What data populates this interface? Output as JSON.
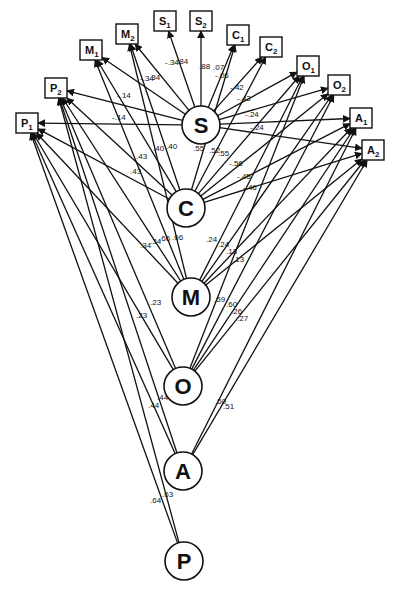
{
  "diagram": {
    "type": "path-diagram",
    "latent_nodes": [
      {
        "id": "S",
        "label": "S",
        "x": 201,
        "y": 125
      },
      {
        "id": "C",
        "label": "C",
        "x": 186,
        "y": 208
      },
      {
        "id": "M",
        "label": "M",
        "x": 191,
        "y": 297
      },
      {
        "id": "O",
        "label": "O",
        "x": 183,
        "y": 386
      },
      {
        "id": "A",
        "label": "A",
        "x": 183,
        "y": 471
      },
      {
        "id": "P",
        "label": "P",
        "x": 184,
        "y": 561
      }
    ],
    "indicator_nodes": [
      {
        "id": "P1",
        "label": "P",
        "sub": "1",
        "x": 27,
        "y": 123
      },
      {
        "id": "P2",
        "label": "P",
        "sub": "2",
        "x": 56,
        "y": 88
      },
      {
        "id": "M1",
        "label": "M",
        "sub": "1",
        "x": 91,
        "y": 50
      },
      {
        "id": "M2",
        "label": "M",
        "sub": "2",
        "x": 127,
        "y": 34
      },
      {
        "id": "S1",
        "label": "S",
        "sub": "1",
        "x": 165,
        "y": 21
      },
      {
        "id": "S2",
        "label": "S",
        "sub": "2",
        "x": 201,
        "y": 21
      },
      {
        "id": "C1",
        "label": "C",
        "sub": "1",
        "x": 238,
        "y": 35
      },
      {
        "id": "C2",
        "label": "C",
        "sub": "2",
        "x": 271,
        "y": 47
      },
      {
        "id": "O1",
        "label": "O",
        "sub": "1",
        "x": 308,
        "y": 66
      },
      {
        "id": "O2",
        "label": "O",
        "sub": "2",
        "x": 339,
        "y": 85
      },
      {
        "id": "A1",
        "label": "A",
        "sub": "1",
        "x": 361,
        "y": 118
      },
      {
        "id": "A2",
        "label": "A",
        "sub": "2",
        "x": 373,
        "y": 150
      }
    ],
    "edges": [
      {
        "from": "S",
        "to": "S1",
        "coef": "-.34"
      },
      {
        "from": "S",
        "to": "S2",
        "coef": ".84"
      },
      {
        "from": "S",
        "to": "M2",
        "coef": "-.34"
      },
      {
        "from": "S",
        "to": "M1",
        "coef": ".34"
      },
      {
        "from": "S",
        "to": "P2",
        "coef": "-.14"
      },
      {
        "from": "S",
        "to": "P1",
        "coef": "-.14"
      },
      {
        "from": "S",
        "to": "C1",
        "coef": ".88"
      },
      {
        "from": "S",
        "to": "C2",
        "coef": ".07"
      },
      {
        "from": "S",
        "to": "O1",
        "coef": "-.06"
      },
      {
        "from": "S",
        "to": "O2",
        "coef": "-.42"
      },
      {
        "from": "S",
        "to": "A1",
        "coef": "-.43"
      },
      {
        "from": "S",
        "to": "A2",
        "coef": "-.24"
      },
      {
        "from": "C",
        "to": "M2",
        "coef": ".40"
      },
      {
        "from": "C",
        "to": "M1",
        "coef": ".40"
      },
      {
        "from": "C",
        "to": "P2",
        "coef": ".43"
      },
      {
        "from": "C",
        "to": "P1",
        "coef": ".43"
      },
      {
        "from": "C",
        "to": "C1",
        "coef": ".55"
      },
      {
        "from": "C",
        "to": "C2",
        "coef": ".52"
      },
      {
        "from": "C",
        "to": "O1",
        "coef": ".55"
      },
      {
        "from": "C",
        "to": "O2",
        "coef": "-.56"
      },
      {
        "from": "C",
        "to": "A1",
        "coef": "-.45"
      },
      {
        "from": "C",
        "to": "A2",
        "coef": "-.46"
      },
      {
        "from": "M",
        "to": "P1",
        "coef": ".34"
      },
      {
        "from": "M",
        "to": "P2",
        "coef": ".34"
      },
      {
        "from": "M",
        "to": "M1",
        "coef": ".66"
      },
      {
        "from": "M",
        "to": "M2",
        "coef": ".66"
      },
      {
        "from": "M",
        "to": "O1",
        "coef": ".24"
      },
      {
        "from": "M",
        "to": "O2",
        "coef": ".24"
      },
      {
        "from": "M",
        "to": "A1",
        "coef": ".13"
      },
      {
        "from": "M",
        "to": "A2",
        "coef": ".13"
      },
      {
        "from": "O",
        "to": "P2",
        "coef": ".23"
      },
      {
        "from": "O",
        "to": "P1",
        "coef": ".23"
      },
      {
        "from": "O",
        "to": "O1",
        "coef": ".59"
      },
      {
        "from": "O",
        "to": "O2",
        "coef": ".60"
      },
      {
        "from": "O",
        "to": "A1",
        "coef": ".26"
      },
      {
        "from": "O",
        "to": "A2",
        "coef": ".27"
      },
      {
        "from": "A",
        "to": "P2",
        "coef": ".44"
      },
      {
        "from": "A",
        "to": "P1",
        "coef": ".44"
      },
      {
        "from": "A",
        "to": "A1",
        "coef": ".50"
      },
      {
        "from": "A",
        "to": "A2",
        "coef": ".51"
      },
      {
        "from": "P",
        "to": "P1",
        "coef": ".64"
      },
      {
        "from": "P",
        "to": "P2",
        "coef": ".63"
      }
    ],
    "labels": [
      {
        "text": "-.34",
        "x": 165,
        "y": 65
      },
      {
        "text": ".84",
        "x": 177,
        "y": 64
      },
      {
        "text": "-.34",
        "x": 140,
        "y": 81
      },
      {
        "text": ".34",
        "x": 149,
        "y": 80
      },
      {
        "text": "-.14",
        "x": 117,
        "y": 98
      },
      {
        "text": "-.14",
        "x": 112,
        "y": 120
      },
      {
        "text": ".88",
        "x": 199,
        "y": 69
      },
      {
        "text": ".07",
        "x": 213,
        "y": 70
      },
      {
        "text": "-.06",
        "x": 215,
        "y": 78
      },
      {
        "text": "-.42",
        "x": 230,
        "y": 90
      },
      {
        "text": "-.43",
        "x": 237,
        "y": 101
      },
      {
        "text": "-.24",
        "x": 245,
        "y": 117
      },
      {
        "text": "-.24",
        "x": 250,
        "y": 130
      },
      {
        "text": ".40",
        "x": 153,
        "y": 151
      },
      {
        "text": ".40",
        "x": 166,
        "y": 149
      },
      {
        "text": ".43",
        "x": 136,
        "y": 159
      },
      {
        "text": ".43",
        "x": 130,
        "y": 174
      },
      {
        "text": ".55",
        "x": 193,
        "y": 151
      },
      {
        "text": ".52",
        "x": 209,
        "y": 153
      },
      {
        "text": ".55",
        "x": 218,
        "y": 156
      },
      {
        "text": "-.56",
        "x": 229,
        "y": 166
      },
      {
        "text": "-.45",
        "x": 237,
        "y": 179
      },
      {
        "text": "-.46",
        "x": 243,
        "y": 190
      },
      {
        "text": ".34",
        "x": 140,
        "y": 248
      },
      {
        "text": ".34",
        "x": 150,
        "y": 244
      },
      {
        "text": ".66",
        "x": 159,
        "y": 241
      },
      {
        "text": ".66",
        "x": 172,
        "y": 240
      },
      {
        "text": ".24",
        "x": 206,
        "y": 242
      },
      {
        "text": ".24",
        "x": 218,
        "y": 247
      },
      {
        "text": ".13",
        "x": 226,
        "y": 254
      },
      {
        "text": ".13",
        "x": 233,
        "y": 262
      },
      {
        "text": ".23",
        "x": 150,
        "y": 305
      },
      {
        "text": ".23",
        "x": 136,
        "y": 318
      },
      {
        "text": ".59",
        "x": 214,
        "y": 302
      },
      {
        "text": ".60",
        "x": 226,
        "y": 307
      },
      {
        "text": ".26",
        "x": 231,
        "y": 314
      },
      {
        "text": ".27",
        "x": 237,
        "y": 321
      },
      {
        "text": ".44",
        "x": 157,
        "y": 400
      },
      {
        "text": ".44",
        "x": 148,
        "y": 408
      },
      {
        "text": ".50",
        "x": 215,
        "y": 404
      },
      {
        "text": ".51",
        "x": 223,
        "y": 409
      },
      {
        "text": ".63",
        "x": 162,
        "y": 497
      },
      {
        "text": ".64",
        "x": 150,
        "y": 503
      }
    ]
  }
}
